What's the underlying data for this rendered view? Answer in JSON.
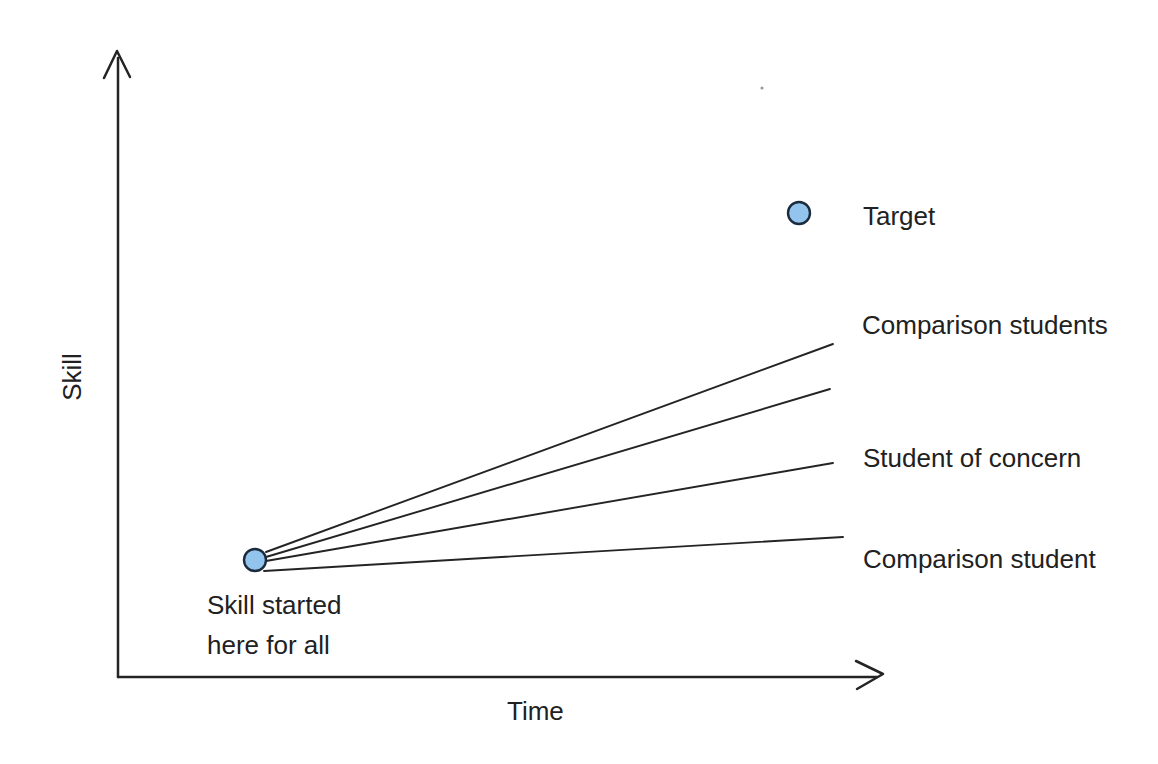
{
  "figure": {
    "ylabel": "Skill",
    "xlabel": "Time",
    "annotations": {
      "target": "Target",
      "comparison_students": "Comparison students",
      "student_of_concern": "Student of concern",
      "comparison_student": "Comparison student",
      "start_note": "Skill started\nhere for all"
    }
  },
  "colors": {
    "background": "#ffffff",
    "stroke": "#242424",
    "text": "#212121",
    "dot_fill": "#92c4ee",
    "dot_stroke": "#1b2b3c"
  },
  "chart_data": {
    "type": "line",
    "title": "",
    "xlabel": "Time",
    "ylabel": "Skill",
    "axes": {
      "quantitative": false,
      "ticks": "none",
      "grid": false,
      "x_range_norm": [
        0,
        1
      ],
      "y_range_norm": [
        0,
        1
      ]
    },
    "legend_position": "inline-right",
    "series": [
      {
        "name": "Comparison students",
        "style": "straight-line",
        "points_norm": [
          [
            0.195,
            0.2
          ],
          [
            0.931,
            0.532
          ]
        ]
      },
      {
        "name": "Comparison students",
        "style": "straight-line",
        "points_norm": [
          [
            0.195,
            0.192
          ],
          [
            0.927,
            0.46
          ]
        ]
      },
      {
        "name": "Student of concern",
        "style": "straight-line",
        "points_norm": [
          [
            0.195,
            0.185
          ],
          [
            0.931,
            0.342
          ]
        ]
      },
      {
        "name": "Comparison student",
        "style": "straight-line",
        "points_norm": [
          [
            0.19,
            0.169
          ],
          [
            0.944,
            0.224
          ]
        ]
      }
    ],
    "markers": [
      {
        "label": "Skill started here for all",
        "x_norm": 0.178,
        "y_norm": 0.187,
        "shape": "filled-circle"
      },
      {
        "label": "Target",
        "x_norm": 0.887,
        "y_norm": 0.741,
        "shape": "filled-circle"
      }
    ],
    "reading": "All students start at the same skill level; comparison students' trend lines rise faster than the student of concern; one comparison student stays nearly flat; the target sits well above all trend lines."
  },
  "geometry": {
    "stroke_color": "#242424",
    "axis_width": 2.5,
    "trend_width": 1.9,
    "y_axis": {
      "x": 118,
      "bottom": 677,
      "top": 58,
      "arrow": "104,78 117,51 130,77"
    },
    "x_axis": {
      "y": 677,
      "left": 118,
      "right": 877,
      "arrow": "856,661 883,674 857,689"
    },
    "fan_lines": [
      {
        "name": "comparison-students-upper",
        "x1": 266,
        "y1": 552,
        "x2": 833,
        "y2": 344
      },
      {
        "name": "comparison-students-lower",
        "x1": 266,
        "y1": 557,
        "x2": 830,
        "y2": 389
      },
      {
        "name": "student-of-concern",
        "x1": 266,
        "y1": 561,
        "x2": 833,
        "y2": 463
      },
      {
        "name": "comparison-student",
        "x1": 264,
        "y1": 571,
        "x2": 843,
        "y2": 537
      }
    ],
    "start_dot": {
      "cx": 255,
      "cy": 560,
      "r": 11,
      "name": "start-point-dot"
    },
    "target_dot": {
      "cx": 799,
      "cy": 213,
      "r": 11,
      "name": "target-point-dot"
    },
    "speck": {
      "cx": 762,
      "cy": 88,
      "r": 1.6
    }
  }
}
